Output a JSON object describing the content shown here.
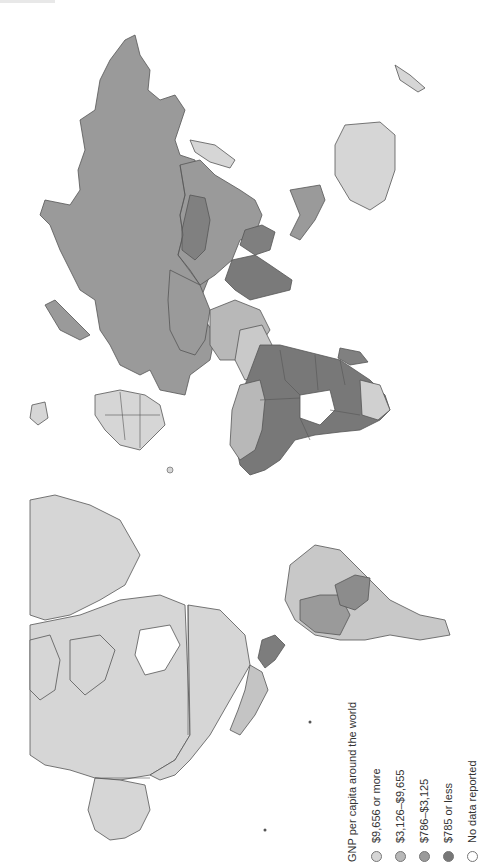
{
  "figure": {
    "orientation": "rotated 90° counter-clockwise (north to the left)"
  },
  "legend": {
    "title": "GNP per capita around the world",
    "items": [
      {
        "label": "$9,656 or more",
        "color": "#d6d6d6"
      },
      {
        "label": "$3,126–$9,655",
        "color": "#b8b8b8"
      },
      {
        "label": "$786–$3,125",
        "color": "#9a9a9a"
      },
      {
        "label": "$785 or less",
        "color": "#777777"
      },
      {
        "label": "No data reported",
        "color": "#ffffff"
      }
    ]
  },
  "regions": {
    "north_america": {
      "class": "$9,656 or more",
      "color": "#d6d6d6"
    },
    "greenland": {
      "class": "$9,656 or more",
      "color": "#d6d6d6"
    },
    "central_america": {
      "class": "$785 or less / $786–$3,125",
      "color": "#888888"
    },
    "south_america": {
      "class": "$3,126–$9,655 / $786–$3,125",
      "color": "#b8b8b8"
    },
    "russia": {
      "class": "$786–$3,125",
      "color": "#9a9a9a"
    },
    "china": {
      "class": "$786–$3,125",
      "color": "#9a9a9a"
    },
    "mongolia": {
      "class": "$785 or less",
      "color": "#808080"
    },
    "south_asia": {
      "class": "$785 or less",
      "color": "#7a7a7a"
    },
    "western_europe": {
      "class": "$9,656 or more",
      "color": "#d6d6d6"
    },
    "middle_east": {
      "class": "mixed",
      "color": "#b8b8b8"
    },
    "africa": {
      "class": "$785 or less",
      "color": "#787878"
    },
    "australia": {
      "class": "$9,656 or more",
      "color": "#d6d6d6"
    },
    "japan": {
      "class": "$9,656 or more",
      "color": "#d6d6d6"
    },
    "southeast_asia": {
      "class": "$786–$3,125",
      "color": "#9a9a9a"
    }
  }
}
